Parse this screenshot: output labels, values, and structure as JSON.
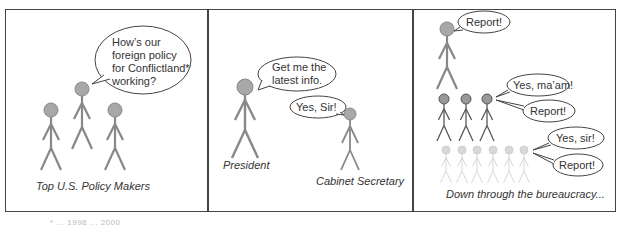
{
  "comic": {
    "panels": [
      {
        "caption": "Top U.S. Policy Makers",
        "bubbles": [
          {
            "lines": [
              "How’s our",
              "foreign policy",
              "for Conflictland*",
              "working?"
            ]
          }
        ]
      },
      {
        "captions": {
          "president": "President",
          "secretary": "Cabinet Secretary"
        },
        "bubbles": [
          {
            "lines": [
              "Get me the",
              "latest info."
            ]
          },
          {
            "lines": [
              "Yes, Sir!"
            ]
          }
        ]
      },
      {
        "caption": "Down through the bureaucracy...",
        "bubbles": [
          {
            "lines": [
              "Report!"
            ]
          },
          {
            "lines": [
              "Yes, ma’am!"
            ]
          },
          {
            "lines": [
              "Report!"
            ]
          },
          {
            "lines": [
              "Yes, sir!"
            ]
          },
          {
            "lines": [
              "Report!"
            ]
          }
        ]
      }
    ],
    "footnote": "* ... 1998 ... 2000",
    "colors": {
      "border": "#444444",
      "figure_top": "#888888",
      "figure_mid": "#555555",
      "figure_light": "#cccccc",
      "head_fill": "#a8a8a8",
      "text": "#333333"
    }
  }
}
